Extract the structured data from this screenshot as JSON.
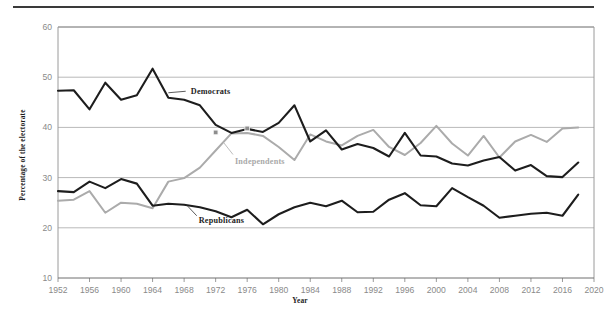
{
  "figure": {
    "title": "",
    "top_rule": true
  },
  "chart_data": {
    "type": "line",
    "title": "",
    "xlabel": "Year",
    "ylabel": "Percentage of the electorate",
    "xlim": [
      1952,
      2020
    ],
    "ylim": [
      10,
      60
    ],
    "xticks": [
      1952,
      1956,
      1960,
      1964,
      1968,
      1972,
      1976,
      1980,
      1984,
      1988,
      1992,
      1996,
      2000,
      2004,
      2008,
      2012,
      2016,
      2020
    ],
    "yticks": [
      10,
      20,
      30,
      40,
      50,
      60
    ],
    "grid": "horizontal",
    "legend_position": "inline-annotations",
    "x": [
      1952,
      1954,
      1956,
      1958,
      1960,
      1962,
      1964,
      1966,
      1968,
      1970,
      1972,
      1974,
      1976,
      1978,
      1980,
      1982,
      1984,
      1986,
      1988,
      1990,
      1992,
      1994,
      1996,
      1998,
      2000,
      2002,
      2004,
      2006,
      2008,
      2010,
      2012,
      2014,
      2016,
      2018
    ],
    "series": [
      {
        "name": "Democrats",
        "color": "#1d1d1d",
        "label_x": 1968,
        "label_y": 47.2,
        "values": [
          47.3,
          47.4,
          43.6,
          48.9,
          45.5,
          46.4,
          51.7,
          45.9,
          45.5,
          44.4,
          40.5,
          38.9,
          39.7,
          39.1,
          40.9,
          44.4,
          37.2,
          39.4,
          35.6,
          36.7,
          35.9,
          34.2,
          38.9,
          34.4,
          34.2,
          32.8,
          32.4,
          33.4,
          34.1,
          31.4,
          32.5,
          30.3,
          30.1,
          33.0
        ]
      },
      {
        "name": "Independents",
        "color": "#ababab",
        "label_x": 1975,
        "label_y": 33.8,
        "values": [
          25.4,
          25.6,
          27.3,
          23.0,
          25.0,
          24.8,
          23.9,
          29.2,
          29.9,
          32.0,
          35.4,
          38.8,
          38.9,
          38.3,
          36.1,
          33.5,
          38.6,
          37.2,
          36.4,
          38.3,
          39.5,
          36.1,
          34.5,
          36.9,
          40.3,
          36.8,
          34.4,
          38.3,
          34.0,
          37.2,
          38.5,
          37.1,
          39.8,
          40.0
        ]
      },
      {
        "name": "Republicans",
        "color": "#1d1d1d",
        "label_x": 1971,
        "label_y": 21.7,
        "values": [
          27.3,
          27.1,
          29.2,
          27.9,
          29.7,
          28.8,
          24.4,
          24.8,
          24.6,
          24.1,
          23.3,
          22.1,
          23.6,
          20.7,
          22.7,
          24.1,
          25.0,
          24.3,
          25.4,
          23.1,
          23.2,
          25.6,
          26.9,
          24.5,
          24.3,
          27.9,
          26.1,
          24.4,
          22.0,
          22.4,
          22.8,
          23.0,
          22.4,
          26.6
        ]
      }
    ],
    "markers": [
      {
        "x": 1972,
        "y": 39.0,
        "series": "crossover"
      },
      {
        "x": 1976,
        "y": 39.8,
        "series": "crossover"
      }
    ]
  }
}
